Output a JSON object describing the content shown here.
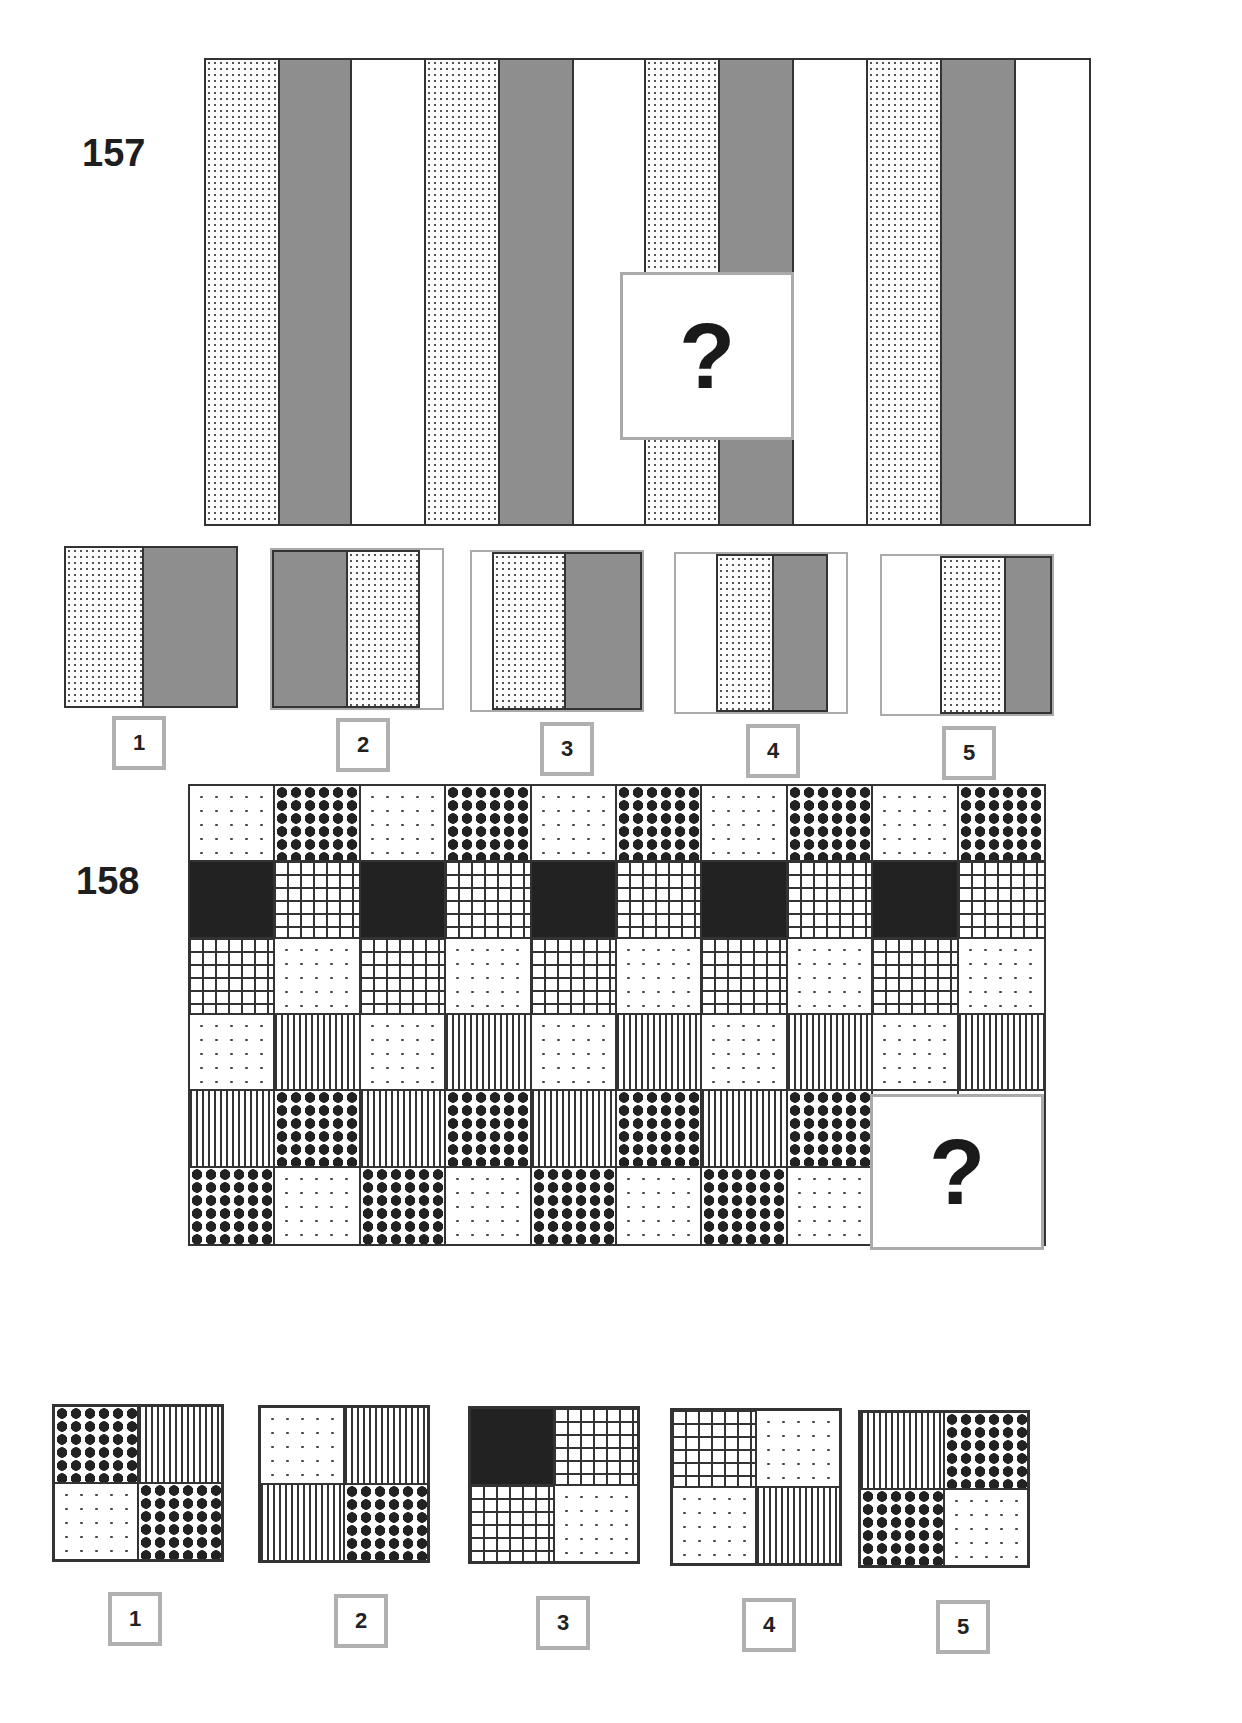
{
  "puzzles": [
    {
      "number": "157",
      "question_mark": "?",
      "stripe_pattern": [
        "dotted",
        "gray",
        "white",
        "dotted",
        "gray",
        "white",
        "dotted",
        "gray",
        "white",
        "dotted",
        "gray",
        "white"
      ],
      "options": [
        {
          "label": "1",
          "cells": [
            "dotted",
            "gray"
          ]
        },
        {
          "label": "2",
          "cells": [
            "gray",
            "dotted",
            "white"
          ]
        },
        {
          "label": "3",
          "cells": [
            "white",
            "dotted",
            "gray"
          ]
        },
        {
          "label": "4",
          "cells": [
            "white",
            "dotted",
            "gray",
            "white"
          ]
        },
        {
          "label": "5",
          "cells": [
            "white",
            "dotted",
            "gray"
          ]
        }
      ]
    },
    {
      "number": "158",
      "question_mark": "?",
      "grid_rows": [
        [
          "sparse",
          "diamond",
          "sparse",
          "diamond",
          "sparse",
          "diamond",
          "sparse",
          "diamond",
          "sparse",
          "diamond"
        ],
        [
          "black",
          "grid",
          "black",
          "grid",
          "black",
          "grid",
          "black",
          "grid",
          "black",
          "grid"
        ],
        [
          "grid",
          "sparse",
          "grid",
          "sparse",
          "grid",
          "sparse",
          "grid",
          "sparse",
          "grid",
          "sparse"
        ],
        [
          "sparse",
          "vlines",
          "sparse",
          "vlines",
          "sparse",
          "vlines",
          "sparse",
          "vlines",
          "sparse",
          "vlines"
        ],
        [
          "vlines",
          "diamond",
          "vlines",
          "diamond",
          "vlines",
          "diamond",
          "vlines",
          "diamond",
          "missing",
          "missing"
        ],
        [
          "diamond",
          "sparse",
          "diamond",
          "sparse",
          "diamond",
          "sparse",
          "diamond",
          "sparse",
          "missing",
          "missing"
        ]
      ],
      "options": [
        {
          "label": "1",
          "cells": [
            "diamond",
            "vlines",
            "sparse",
            "diamond"
          ]
        },
        {
          "label": "2",
          "cells": [
            "sparse",
            "vlines",
            "vlines",
            "diamond"
          ]
        },
        {
          "label": "3",
          "cells": [
            "black",
            "grid",
            "grid",
            "sparse"
          ]
        },
        {
          "label": "4",
          "cells": [
            "grid",
            "sparse",
            "sparse",
            "vlines"
          ]
        },
        {
          "label": "5",
          "cells": [
            "vlines",
            "diamond",
            "diamond",
            "sparse"
          ]
        }
      ]
    }
  ]
}
